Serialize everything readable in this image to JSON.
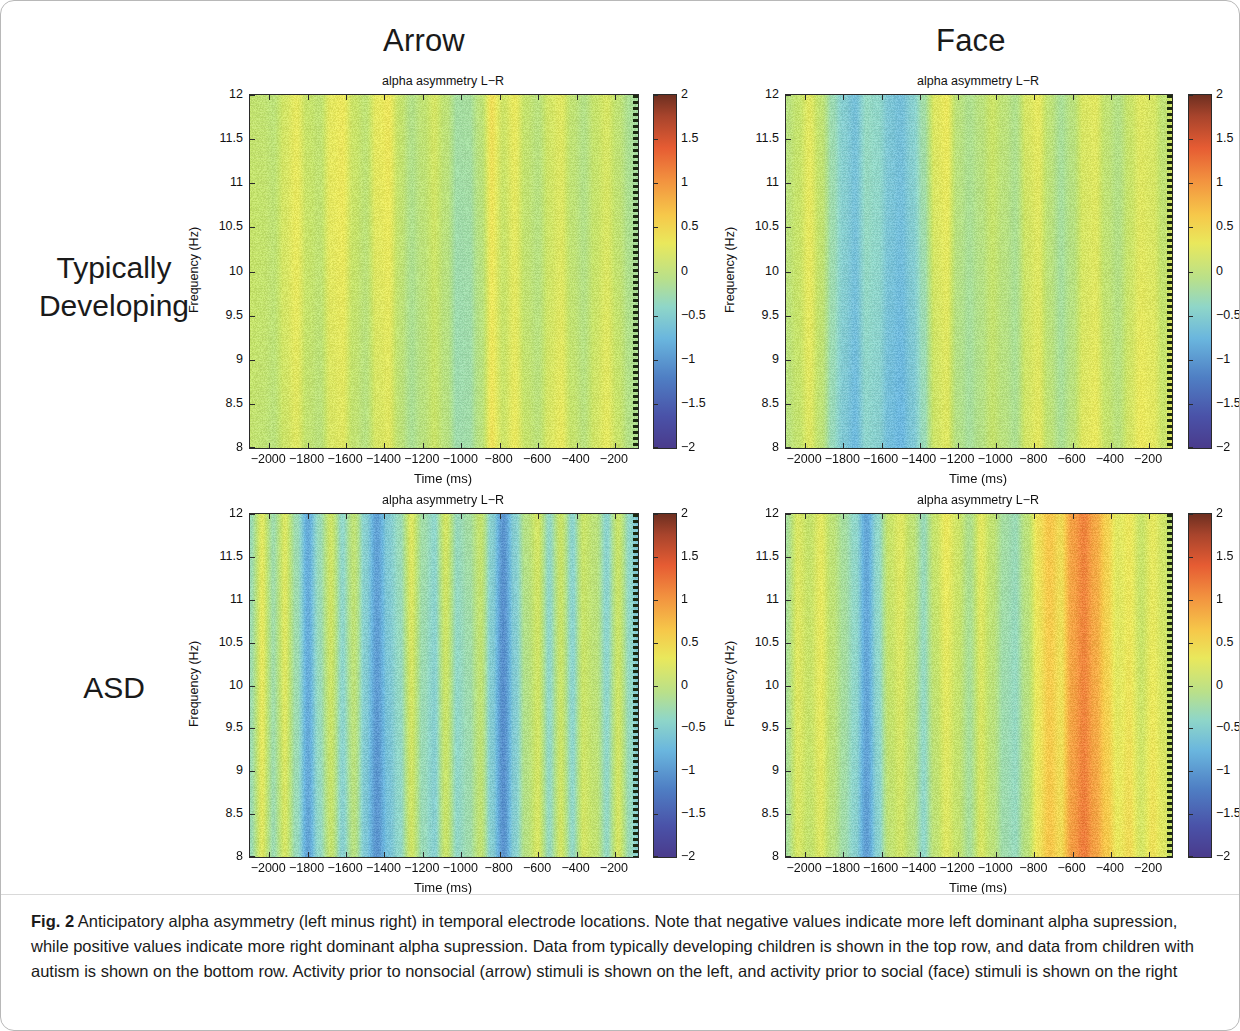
{
  "figure": {
    "column_headers": [
      {
        "id": "arrow",
        "label": "Arrow"
      },
      {
        "id": "face",
        "label": "Face"
      }
    ],
    "row_labels": [
      {
        "id": "td",
        "line1": "Typically",
        "line2": "Developing"
      },
      {
        "id": "asd",
        "label": "ASD"
      }
    ],
    "panel_title": "alpha asymmetry L−R",
    "caption_bold": "Fig. 2",
    "caption_text": " Anticipatory alpha asymmetry (left minus right) in temporal electrode locations. Note that negative values indicate more left dominant alpha supression, while positive values indicate more right dominant alpha supression. Data from typically developing children is shown in the top row, and data from children with autism is shown on the bottom row. Activity prior to nonsocial (arrow) stimuli is shown on the left, and activity prior to social (face) stimuli is shown on the right"
  },
  "axes": {
    "xlabel": "Time (ms)",
    "ylabel": "Frequency (Hz)",
    "xticks": [
      -2000,
      -1800,
      -1600,
      -1400,
      -1200,
      -1000,
      -800,
      -600,
      -400,
      -200
    ],
    "xtick_labels": [
      "−2000",
      "−1800",
      "−1600",
      "−1400",
      "−1200",
      "−1000",
      "−800",
      "−600",
      "−400",
      "−200"
    ],
    "xlim": [
      -2100,
      -80
    ],
    "yticks": [
      8,
      8.5,
      9,
      9.5,
      10,
      10.5,
      11,
      11.5,
      12
    ],
    "ytick_labels": [
      "8",
      "8.5",
      "9",
      "9.5",
      "10",
      "10.5",
      "11",
      "11.5",
      "12"
    ],
    "ylim": [
      8,
      12
    ]
  },
  "colorbar": {
    "ticks": [
      -2,
      -1.5,
      -1,
      -0.5,
      0,
      0.5,
      1,
      1.5,
      2
    ],
    "tick_labels": [
      "−2",
      "−1.5",
      "−1",
      "−0.5",
      "0",
      "0.5",
      "1",
      "1.5",
      "2"
    ],
    "vmin": -2,
    "vmax": 2,
    "colormap": "jet-like",
    "stops": [
      "#4a3b8c",
      "#4a52a8",
      "#4f7fc4",
      "#6ab6de",
      "#8fd6c8",
      "#b9e08a",
      "#e9e85c",
      "#f6c84a",
      "#f2913f",
      "#e65c33",
      "#a8442c",
      "#6e2f20"
    ]
  },
  "chart_data": {
    "type": "heatmap",
    "title": "alpha asymmetry L−R",
    "xlabel": "Time (ms)",
    "ylabel": "Frequency (Hz)",
    "xlim": [
      -2100,
      -80
    ],
    "ylim": [
      8,
      12
    ],
    "zlim": [
      -2,
      2
    ],
    "zlabel": "alpha asymmetry (left minus right)",
    "grid": false,
    "legend": "colorbar-right",
    "note": "Values are essentially constant across frequency (8-12 Hz); each panel is described by a time profile of the asymmetry value sampled at the listed times.",
    "panels": [
      {
        "group": "Typically Developing",
        "condition": "Arrow",
        "row": 0,
        "col": 0,
        "time_ms": [
          -2100,
          -2040,
          -1980,
          -1920,
          -1860,
          -1800,
          -1740,
          -1680,
          -1620,
          -1560,
          -1500,
          -1440,
          -1380,
          -1320,
          -1260,
          -1200,
          -1140,
          -1080,
          -1020,
          -960,
          -900,
          -840,
          -780,
          -720,
          -660,
          -600,
          -540,
          -480,
          -420,
          -360,
          -300,
          -240,
          -180,
          -120,
          -80
        ],
        "values": [
          0.18,
          0.16,
          0.1,
          0.3,
          0.42,
          0.2,
          0.12,
          0.4,
          0.45,
          0.22,
          0.1,
          0.4,
          0.46,
          0.18,
          -0.05,
          0.12,
          0.3,
          0.1,
          -0.2,
          -0.18,
          0.1,
          0.55,
          0.3,
          0.48,
          0.22,
          0.1,
          0.35,
          0.44,
          0.2,
          0.05,
          0.28,
          0.4,
          0.2,
          -0.05,
          -0.12
        ]
      },
      {
        "group": "Typically Developing",
        "condition": "Face",
        "row": 0,
        "col": 1,
        "time_ms": [
          -2100,
          -2040,
          -1980,
          -1920,
          -1860,
          -1800,
          -1740,
          -1680,
          -1620,
          -1560,
          -1500,
          -1440,
          -1380,
          -1320,
          -1260,
          -1200,
          -1140,
          -1080,
          -1020,
          -960,
          -900,
          -840,
          -780,
          -720,
          -660,
          -600,
          -540,
          -480,
          -420,
          -360,
          -300,
          -240,
          -180,
          -120,
          -80
        ],
        "values": [
          0.05,
          0.2,
          0.4,
          0.15,
          -0.3,
          -0.55,
          -0.7,
          -0.4,
          -0.45,
          -0.65,
          -0.72,
          -0.55,
          -0.25,
          0.35,
          0.45,
          0.05,
          -0.1,
          0.05,
          0.25,
          0.1,
          -0.05,
          0.35,
          0.45,
          0.15,
          -0.1,
          0.1,
          0.4,
          0.45,
          0.2,
          0.05,
          0.3,
          0.45,
          0.4,
          0.2,
          0.35
        ]
      },
      {
        "group": "ASD",
        "condition": "Arrow",
        "row": 1,
        "col": 0,
        "time_ms": [
          -2100,
          -2040,
          -1980,
          -1920,
          -1860,
          -1800,
          -1740,
          -1680,
          -1620,
          -1560,
          -1500,
          -1440,
          -1380,
          -1320,
          -1260,
          -1200,
          -1140,
          -1080,
          -1020,
          -960,
          -900,
          -840,
          -780,
          -720,
          -660,
          -600,
          -540,
          -480,
          -420,
          -360,
          -300,
          -240,
          -180,
          -120,
          -80
        ],
        "values": [
          -0.3,
          0.4,
          -0.25,
          0.35,
          -0.3,
          -0.9,
          -0.35,
          0.25,
          -0.45,
          0.1,
          -0.55,
          -1.0,
          -0.6,
          -0.35,
          0.35,
          -0.25,
          -0.45,
          0.3,
          -0.35,
          -0.2,
          0.2,
          -0.5,
          -1.05,
          -0.5,
          0.05,
          0.35,
          -0.35,
          0.3,
          -0.4,
          0.3,
          0.15,
          -0.4,
          0.3,
          -0.35,
          -0.55
        ]
      },
      {
        "group": "ASD",
        "condition": "Face",
        "row": 1,
        "col": 1,
        "time_ms": [
          -2100,
          -2040,
          -1980,
          -1920,
          -1860,
          -1800,
          -1740,
          -1680,
          -1620,
          -1560,
          -1500,
          -1440,
          -1380,
          -1320,
          -1260,
          -1200,
          -1140,
          -1080,
          -1020,
          -960,
          -900,
          -840,
          -780,
          -720,
          -660,
          -600,
          -540,
          -480,
          -420,
          -360,
          -300,
          -240,
          -180,
          -120,
          -80
        ],
        "values": [
          -0.15,
          0.35,
          0.2,
          0.4,
          0.1,
          -0.2,
          -0.45,
          -0.95,
          -0.45,
          0.2,
          0.35,
          0.1,
          -0.35,
          0.2,
          0.45,
          0.25,
          -0.1,
          0.4,
          0.15,
          -0.2,
          -0.3,
          0.1,
          0.55,
          0.75,
          0.6,
          1.05,
          1.25,
          1.0,
          0.7,
          0.45,
          0.55,
          0.3,
          0.5,
          0.35,
          0.2
        ]
      }
    ]
  }
}
